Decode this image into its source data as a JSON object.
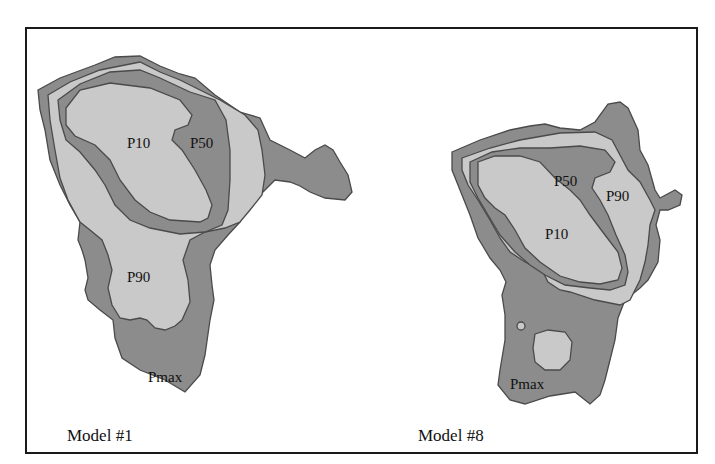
{
  "figure": {
    "panels": [
      {
        "title": "Model #1",
        "region_labels": {
          "p10": "P10",
          "p50": "P50",
          "p90": "P90",
          "pmax": "Pmax"
        }
      },
      {
        "title": "Model #8",
        "region_labels": {
          "p10": "P10",
          "p50": "P50",
          "p90": "P90",
          "pmax": "Pmax"
        }
      }
    ],
    "colors": {
      "dark_fill": "#8c8c8c",
      "light_fill": "#c9c9c9",
      "outline": "#4a4a4a",
      "frame": "#1a1a1a"
    }
  }
}
